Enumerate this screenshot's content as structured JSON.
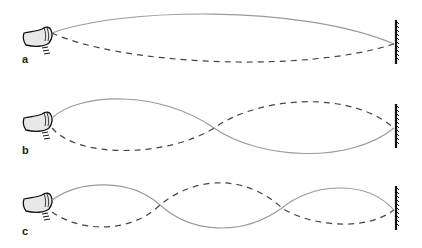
{
  "figure": {
    "panels": [
      {
        "label": "a",
        "harmonic": 1,
        "solid_color": "#9a9a9a",
        "dashed_color": "#444444"
      },
      {
        "label": "b",
        "harmonic": 2,
        "solid_color": "#9a9a9a",
        "dashed_color": "#444444"
      },
      {
        "label": "c",
        "harmonic": 3,
        "solid_color": "#9a9a9a",
        "dashed_color": "#444444"
      }
    ]
  },
  "icons": {
    "hand": "hand-icon",
    "wall": "wall-icon"
  }
}
